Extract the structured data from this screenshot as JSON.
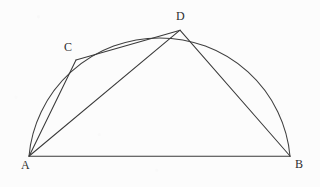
{
  "figure": {
    "background_color": "#fcfcfc",
    "stroke_color": "#3a3a3a",
    "label_color": "#2e2e2e",
    "stroke_width": "1",
    "labels": {
      "A": "A",
      "B": "B",
      "C": "C",
      "D": "D"
    },
    "points": {
      "A": {
        "x": 29,
        "y": 156
      },
      "B": {
        "x": 290,
        "y": 156
      },
      "C": {
        "x": 76,
        "y": 60
      },
      "D": {
        "x": 180,
        "y": 30
      }
    },
    "arc": {
      "start": {
        "x": 29,
        "y": 156
      },
      "end": {
        "x": 290,
        "y": 156
      },
      "radius_x": 131,
      "radius_y": 129,
      "apex": {
        "x": 160,
        "y": 27
      }
    },
    "segments": [
      {
        "name": "AB",
        "from": "A",
        "to": "B"
      },
      {
        "name": "AC",
        "from": "A",
        "to": "C"
      },
      {
        "name": "AD",
        "from": "A",
        "to": "D"
      },
      {
        "name": "CD",
        "from": "C",
        "to": "D"
      },
      {
        "name": "DB",
        "from": "D",
        "to": "B"
      }
    ]
  }
}
